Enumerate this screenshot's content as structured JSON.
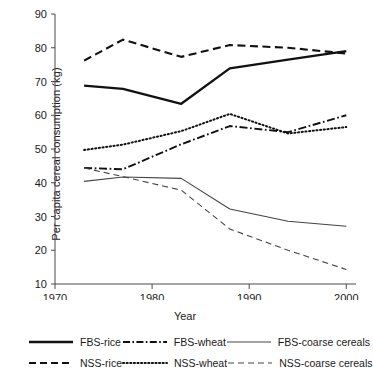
{
  "chart_data": {
    "type": "line",
    "title": "",
    "xlabel": "Year",
    "ylabel": "Per capita cereal consumption (kg)",
    "xlim": [
      1970,
      2001
    ],
    "ylim": [
      10,
      90
    ],
    "xticks": [
      "1970",
      "1980",
      "1990",
      "2000"
    ],
    "xtick_values": [
      1970,
      1980,
      1990,
      2000
    ],
    "yticks": [
      "10",
      "20",
      "30",
      "40",
      "50",
      "60",
      "70",
      "80",
      "90"
    ],
    "ytick_values": [
      10,
      20,
      30,
      40,
      50,
      60,
      70,
      80,
      90
    ],
    "grid": false,
    "legend_position": "bottom",
    "x": [
      1973,
      1977,
      1983,
      1988,
      1994,
      2000
    ],
    "series": [
      {
        "name": "FBS-rice",
        "style": "solid-thick",
        "color": "#111111",
        "values": [
          68.8,
          67.8,
          63.4,
          73.9,
          76.5,
          79.0
        ]
      },
      {
        "name": "FBS-wheat",
        "style": "dash-dot",
        "color": "#111111",
        "values": [
          44.4,
          44.0,
          51.4,
          56.8,
          55.0,
          60.0
        ]
      },
      {
        "name": "FBS-coarse cereals",
        "style": "solid-thin",
        "color": "#444444",
        "values": [
          40.4,
          41.7,
          41.3,
          32.2,
          28.6,
          27.1
        ]
      },
      {
        "name": "NSS-rice",
        "style": "dashed",
        "color": "#111111",
        "values": [
          76.2,
          82.4,
          77.3,
          80.8,
          80.0,
          78.3
        ]
      },
      {
        "name": "NSS-wheat",
        "style": "dotted",
        "color": "#111111",
        "values": [
          49.7,
          51.3,
          55.3,
          60.4,
          54.6,
          56.5
        ]
      },
      {
        "name": "NSS-coarse cereals",
        "style": "dashed-thin",
        "color": "#444444",
        "values": [
          44.4,
          41.8,
          37.8,
          26.3,
          20.0,
          14.3
        ]
      }
    ]
  },
  "legend": {
    "row1": [
      {
        "label": "FBS-rice",
        "style": "solid-thick"
      },
      {
        "label": "FBS-wheat",
        "style": "dash-dot"
      },
      {
        "label": "FBS-coarse cereals",
        "style": "solid-thin"
      }
    ],
    "row2": [
      {
        "label": "NSS-rice",
        "style": "dashed"
      },
      {
        "label": "NSS-wheat",
        "style": "dotted"
      },
      {
        "label": "NSS-coarse cereals",
        "style": "dashed-thin"
      }
    ]
  }
}
